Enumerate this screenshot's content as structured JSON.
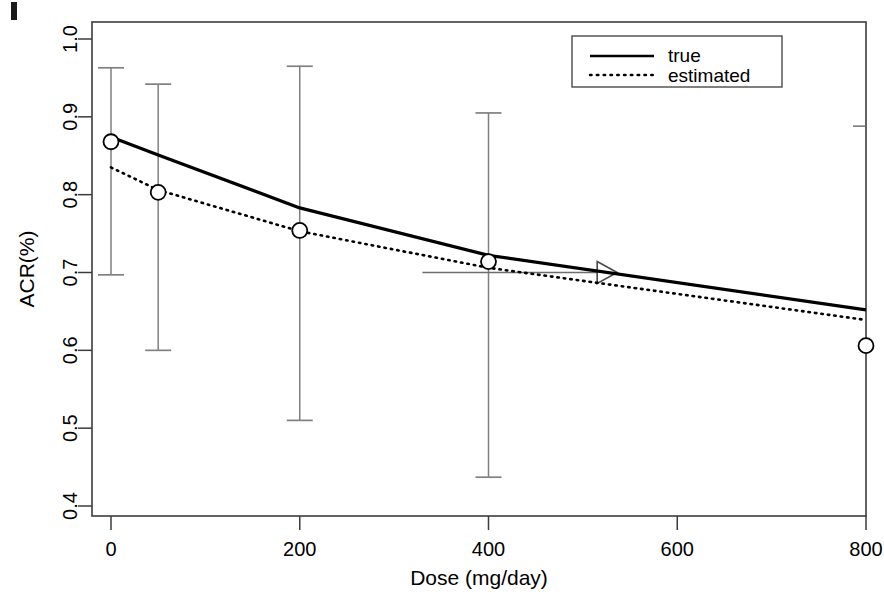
{
  "chart_data": {
    "type": "line",
    "title": "",
    "xlabel": "Dose (mg/day)",
    "ylabel": "ACR(%)",
    "xlim": [
      0,
      800
    ],
    "ylim": [
      0.4,
      1.0
    ],
    "xticks": [
      0,
      200,
      400,
      600,
      800
    ],
    "xtick_labels": [
      "0",
      "200",
      "400",
      "600",
      "800"
    ],
    "yticks": [
      0.4,
      0.5,
      0.6,
      0.7,
      0.8,
      0.9,
      1.0
    ],
    "ytick_labels": [
      "0.4",
      "0.5",
      "0.6",
      "0.7",
      "0.8",
      "0.9",
      "1.0"
    ],
    "grid": false,
    "legend_position": "top-right",
    "x": [
      0,
      50,
      200,
      400,
      800
    ],
    "series": [
      {
        "name": "true",
        "style": "solid",
        "color": "#000000",
        "values": [
          0.874,
          0.851,
          0.783,
          0.722,
          0.652
        ]
      },
      {
        "name": "estimated",
        "style": "dotted",
        "color": "#000000",
        "values": [
          0.835,
          0.806,
          0.753,
          0.706,
          0.639
        ]
      }
    ],
    "markers": {
      "symbol": "open-circle",
      "series": "estimated",
      "points": [
        {
          "x": 0,
          "y": 0.868
        },
        {
          "x": 50,
          "y": 0.803
        },
        {
          "x": 200,
          "y": 0.754
        },
        {
          "x": 400,
          "y": 0.714
        },
        {
          "x": 800,
          "y": 0.606
        }
      ]
    },
    "error_bars": [
      {
        "x": 0,
        "lower": 0.697,
        "upper": 0.963
      },
      {
        "x": 50,
        "lower": 0.6,
        "upper": 0.942
      },
      {
        "x": 200,
        "lower": 0.51,
        "upper": 0.965
      },
      {
        "x": 400,
        "lower": 0.437,
        "upper": 0.905
      },
      {
        "x": 800,
        "lower": 0.355,
        "upper": 0.888
      }
    ],
    "annotations": [
      {
        "type": "arrow",
        "y": 0.7,
        "x_start": 330,
        "x_end": 530,
        "arrowhead": "open-triangle-right"
      }
    ]
  },
  "legend": {
    "entries": [
      {
        "label": "true",
        "style": "solid"
      },
      {
        "label": "estimated",
        "style": "dotted"
      }
    ]
  },
  "colors": {
    "frame": "#3c3c3c",
    "line": "#000000",
    "error_bar": "#808080",
    "annotation": "#6e6e6e"
  }
}
